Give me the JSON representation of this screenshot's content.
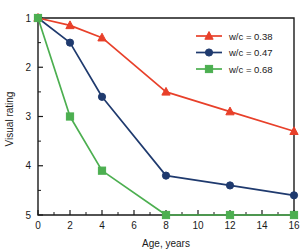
{
  "chart_data": {
    "type": "line",
    "title": "",
    "xlabel": "Age, years",
    "ylabel": "Visual rating",
    "xlim": [
      0,
      16
    ],
    "ylim": [
      1,
      5
    ],
    "y_inverted": true,
    "grid": false,
    "legend_position": "top-right",
    "x_ticks": [
      0,
      2,
      4,
      6,
      8,
      10,
      12,
      14,
      16
    ],
    "x_tick_labels": [
      "0",
      "2",
      "4",
      "6",
      "8",
      "10",
      "12",
      "14",
      "16"
    ],
    "x_minor_ticks": [
      1,
      3,
      5,
      7,
      9,
      11,
      13,
      15
    ],
    "y_ticks": [
      1,
      2,
      3,
      4,
      5
    ],
    "y_tick_labels": [
      "1",
      "2",
      "3",
      "4",
      "5"
    ],
    "y_minor_ticks": [
      1.5,
      2.5,
      3.5,
      4.5
    ],
    "x": [
      0,
      2,
      4,
      8,
      12,
      16
    ],
    "series": [
      {
        "name": "w/c = 0.38",
        "color": "#E8402A",
        "marker": "triangle",
        "values": [
          1.0,
          1.15,
          1.4,
          2.5,
          2.9,
          3.3
        ]
      },
      {
        "name": "w/c = 0.47",
        "color": "#1F3A6E",
        "marker": "circle",
        "values": [
          1.0,
          1.5,
          2.6,
          4.2,
          4.4,
          4.6
        ]
      },
      {
        "name": "w/c = 0.68",
        "color": "#4CAF50",
        "marker": "square",
        "values": [
          1.0,
          3.0,
          4.1,
          5.0,
          5.0,
          5.0
        ]
      }
    ]
  },
  "legend": {
    "entries": [
      {
        "label": "w/c = 0.38"
      },
      {
        "label": "w/c = 0.47"
      },
      {
        "label": "w/c = 0.68"
      }
    ]
  },
  "axes": {
    "x_title": "Age, years",
    "y_title": "Visual rating"
  }
}
